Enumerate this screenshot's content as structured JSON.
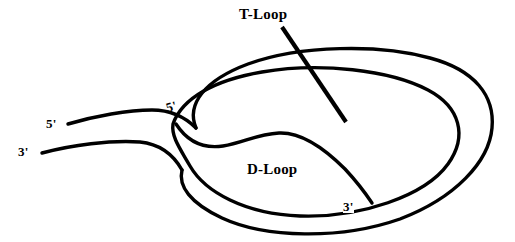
{
  "figure": {
    "background_color": "#ffffff",
    "stroke_color": "#000000",
    "stroke_width": 3.4,
    "width": 515,
    "height": 242
  },
  "labels": {
    "t_loop": "T-Loop",
    "d_loop": "D-Loop",
    "five_prime_tail": "5'",
    "three_prime_tail": "3'",
    "five_prime_junction": "5'",
    "three_prime_invading": "3'"
  },
  "annotations": {
    "leader_line": {
      "name": "t-loop-leader-line",
      "from_x": 282,
      "from_y": 27,
      "to_x": 346,
      "to_y": 122
    }
  },
  "strands": {
    "outer_upper_tail": "M 68 124 C 95 116, 128 110, 152 110 C 172 110, 186 118, 196 128",
    "outer_lower_tail": "M 42 153 C 72 145, 110 140, 140 142 C 160 144, 172 154, 182 170",
    "outer_loop": "M 196 128 C 186 104, 205 80, 248 64 C 300 45, 380 44, 430 58 C 475 70, 495 96, 492 128 C 489 162, 455 198, 400 219 C 340 240, 265 238, 222 218 C 190 203, 178 186, 182 170",
    "inner_loop": "M 173 124 C 182 98, 215 80, 262 72 C 320 62, 390 70, 428 90 C 460 107, 468 136, 448 164 C 425 196, 360 218, 300 216 C 245 214, 205 192, 190 166 C 180 148, 172 136, 173 124",
    "displaced_strand": "M 176 126 C 188 140, 202 148, 222 145 C 242 142, 256 134, 278 133 C 300 132, 322 146, 344 168 C 358 182, 366 194, 372 203",
    "junction_cross": "M 196 128 C 190 134, 184 140, 178 148"
  }
}
